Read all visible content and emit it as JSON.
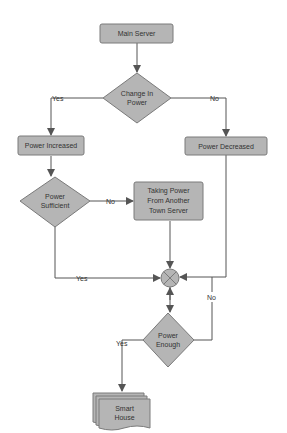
{
  "diagram": {
    "type": "flowchart",
    "colors": {
      "node_fill": "#b5b5b5",
      "node_stroke": "#7a7a7a",
      "edge": "#555555",
      "background": "#ffffff",
      "text": "#333333"
    },
    "nodes": {
      "main_server": {
        "label": "Main Server",
        "shape": "rounded-rectangle"
      },
      "change_in_power": {
        "line1": "Change In",
        "line2": "Power",
        "shape": "diamond"
      },
      "power_increased": {
        "label": "Power Increased",
        "shape": "rounded-rectangle"
      },
      "power_decreased": {
        "label": "Power Decreased",
        "shape": "rounded-rectangle"
      },
      "power_sufficient": {
        "line1": "Power",
        "line2": "Sufficient",
        "shape": "diamond"
      },
      "taking_power": {
        "line1": "Taking Power",
        "line2": "From Another",
        "line3": "Town Server",
        "shape": "rounded-rectangle"
      },
      "junction": {
        "label": "",
        "shape": "summing-junction"
      },
      "power_enough": {
        "line1": "Power",
        "line2": "Enough",
        "shape": "diamond"
      },
      "smart_house": {
        "line1": "Smart",
        "line2": "House",
        "shape": "multi-document"
      }
    },
    "edges": {
      "change_yes": "Yes",
      "change_no": "No",
      "sufficient_no": "No",
      "sufficient_yes": "Yes",
      "enough_no": "No",
      "enough_yes": "Yes"
    }
  }
}
